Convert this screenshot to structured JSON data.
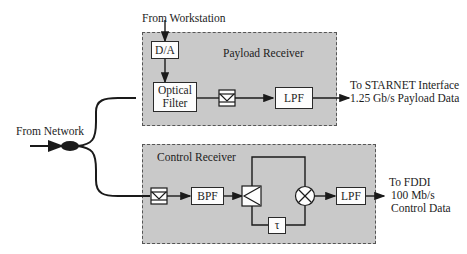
{
  "inputs": {
    "workstation": "From Workstation",
    "network": "From Network"
  },
  "payload_receiver": {
    "title": "Payload Receiver",
    "blocks": {
      "da": "D/A",
      "optical_filter_line1": "Optical",
      "optical_filter_line2": "Filter",
      "photodetector": "photodetector",
      "lpf": "LPF"
    },
    "output": {
      "line1": "To STARNET Interface",
      "line2": "1.25 Gb/s Payload Data"
    }
  },
  "control_receiver": {
    "title": "Control Receiver",
    "blocks": {
      "photodetector": "photodetector",
      "bpf": "BPF",
      "splitter": "splitter",
      "delay": "τ",
      "mixer": "⊗",
      "lpf": "LPF"
    },
    "output": {
      "line1": "To FDDI",
      "line2": "100 Mb/s",
      "line3": "Control Data"
    }
  },
  "colors": {
    "region_fill": "#c9c9c9",
    "line": "#1a1a1a",
    "box_fill": "#fdfdfd"
  }
}
